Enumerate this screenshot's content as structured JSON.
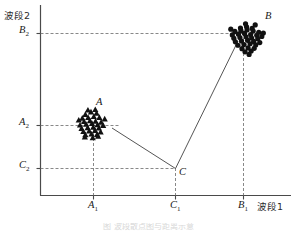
{
  "axes": {
    "ylabel": "波段2",
    "xlabel": "波段1",
    "y_ticks": [
      {
        "id": "B2",
        "base": "B",
        "sub": "2",
        "pixel_y": 33
      },
      {
        "id": "A2",
        "base": "A",
        "sub": "2",
        "pixel_y": 125
      },
      {
        "id": "C2",
        "base": "C",
        "sub": "2",
        "pixel_y": 168
      }
    ],
    "x_ticks": [
      {
        "id": "A1",
        "base": "A",
        "sub": "1",
        "pixel_x": 93
      },
      {
        "id": "C1",
        "base": "C",
        "sub": "1",
        "pixel_x": 175
      },
      {
        "id": "B1",
        "base": "B",
        "sub": "1",
        "pixel_x": 243
      }
    ]
  },
  "labels": {
    "cluster_a": "A",
    "cluster_b": "B",
    "point_c": "C"
  },
  "caption": "图 波段散点图与距离示意",
  "colors": {
    "axis": "#4a4a4a",
    "guide": "#7a7a7a",
    "connector": "#555555",
    "marker": "#111111",
    "background": "#ffffff"
  },
  "chart_data": {
    "type": "scatter",
    "title": "",
    "xlabel": "波段1",
    "ylabel": "波段2",
    "xlim": [
      0,
      100
    ],
    "ylim": [
      0,
      100
    ],
    "grid": false,
    "legend": "none",
    "annotations": [
      {
        "text": "A",
        "x": 25,
        "y": 48,
        "note": "triangle cluster centroid label"
      },
      {
        "text": "B",
        "x": 89,
        "y": 88,
        "note": "round dot cluster label"
      },
      {
        "text": "C",
        "x": 56,
        "y": 14,
        "note": "reference point at (C1, C2)"
      }
    ],
    "reference_lines": [
      {
        "axis": "y",
        "value": 88,
        "label": "B2",
        "style": "dashed"
      },
      {
        "axis": "y",
        "value": 40,
        "label": "A2",
        "style": "dashed"
      },
      {
        "axis": "y",
        "value": 14,
        "label": "C2",
        "style": "dashed"
      },
      {
        "axis": "x",
        "value": 25,
        "label": "A1",
        "style": "dashed"
      },
      {
        "axis": "x",
        "value": 56,
        "label": "C1",
        "style": "dashed"
      },
      {
        "axis": "x",
        "value": 84,
        "label": "B1",
        "style": "dashed"
      }
    ],
    "connectors": [
      {
        "from": "C",
        "to": "A",
        "x1": 56,
        "y1": 14,
        "x2": 27,
        "y2": 41
      },
      {
        "from": "C",
        "to": "B",
        "x1": 56,
        "y1": 14,
        "x2": 83,
        "y2": 86
      }
    ],
    "series": [
      {
        "name": "A",
        "marker": "triangle",
        "color": "#111111",
        "points": [
          [
            22.0,
            45.5
          ],
          [
            24.2,
            46.8
          ],
          [
            26.4,
            46.2
          ],
          [
            20.8,
            43.6
          ],
          [
            23.1,
            43.9
          ],
          [
            25.3,
            44.4
          ],
          [
            27.5,
            44.0
          ],
          [
            21.5,
            41.8
          ],
          [
            23.8,
            42.3
          ],
          [
            26.0,
            42.0
          ],
          [
            28.2,
            41.5
          ],
          [
            19.9,
            40.0
          ],
          [
            22.3,
            40.4
          ],
          [
            24.6,
            40.8
          ],
          [
            26.8,
            40.2
          ],
          [
            29.0,
            39.8
          ],
          [
            20.5,
            38.2
          ],
          [
            22.9,
            38.6
          ],
          [
            25.1,
            38.9
          ],
          [
            27.3,
            38.4
          ],
          [
            21.2,
            36.6
          ],
          [
            23.5,
            36.9
          ],
          [
            25.8,
            37.2
          ],
          [
            28.0,
            36.4
          ],
          [
            22.0,
            35.0
          ],
          [
            24.4,
            35.3
          ],
          [
            26.6,
            35.1
          ],
          [
            19.4,
            42.6
          ],
          [
            29.6,
            43.2
          ],
          [
            23.0,
            47.8
          ],
          [
            25.9,
            48.1
          ],
          [
            27.0,
            34.2
          ],
          [
            21.8,
            33.8
          ],
          [
            24.9,
            33.4
          ]
        ]
      },
      {
        "name": "B",
        "marker": "circle",
        "color": "#111111",
        "points": [
          [
            83.0,
            90.6
          ],
          [
            85.4,
            91.2
          ],
          [
            87.6,
            90.4
          ],
          [
            80.8,
            88.8
          ],
          [
            83.2,
            89.2
          ],
          [
            85.6,
            89.6
          ],
          [
            88.0,
            89.0
          ],
          [
            90.2,
            88.4
          ],
          [
            79.8,
            87.0
          ],
          [
            82.2,
            87.4
          ],
          [
            84.6,
            87.8
          ],
          [
            87.0,
            87.2
          ],
          [
            89.4,
            86.8
          ],
          [
            91.4,
            86.2
          ],
          [
            80.4,
            85.2
          ],
          [
            82.8,
            85.6
          ],
          [
            85.2,
            86.0
          ],
          [
            87.4,
            85.4
          ],
          [
            89.8,
            85.0
          ],
          [
            81.0,
            83.4
          ],
          [
            83.4,
            83.8
          ],
          [
            85.8,
            84.2
          ],
          [
            88.2,
            83.6
          ],
          [
            90.6,
            83.0
          ],
          [
            82.0,
            81.6
          ],
          [
            84.4,
            82.0
          ],
          [
            86.8,
            82.4
          ],
          [
            89.0,
            81.8
          ],
          [
            83.6,
            79.8
          ],
          [
            86.0,
            80.2
          ],
          [
            88.4,
            80.0
          ],
          [
            84.8,
            78.2
          ],
          [
            87.2,
            78.6
          ],
          [
            85.0,
            92.8
          ],
          [
            88.8,
            92.2
          ],
          [
            79.2,
            90.0
          ],
          [
            92.0,
            88.0
          ],
          [
            86.4,
            76.8
          ]
        ]
      }
    ]
  }
}
